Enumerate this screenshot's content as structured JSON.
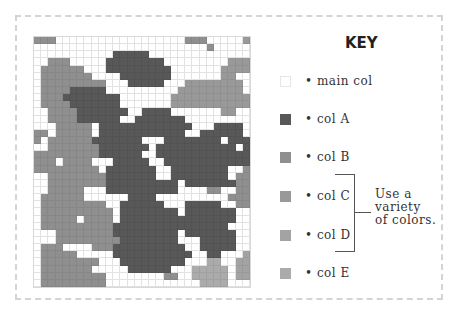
{
  "key": {
    "title": "KEY",
    "items": [
      {
        "label": "• main col",
        "color": "#ffffff",
        "border": "#e6e6e6"
      },
      {
        "label": "• col A",
        "color": "#585858",
        "border": "#585858"
      },
      {
        "label": "• col B",
        "color": "#8f8f8f",
        "border": "#8f8f8f"
      },
      {
        "label": "• col C",
        "color": "#999999",
        "border": "#999999"
      },
      {
        "label": "• col D",
        "color": "#a3a3a3",
        "border": "#a3a3a3"
      },
      {
        "label": "• col E",
        "color": "#ababab",
        "border": "#ababab"
      }
    ],
    "note": [
      "Use a",
      "variety",
      "of colors."
    ]
  },
  "grid": {
    "cols": 30,
    "rows": 35,
    "palette": {
      ".": "#ffffff",
      "A": "#585858",
      "B": "#8f8f8f",
      "C": "#999999",
      "D": "#a3a3a3",
      "E": "#ababab"
    },
    "cells": [
      "BBB..................BBB.....C",
      "........................B.....",
      "...........AAAAA..............",
      "..BBB.....AAAAAAAA.........CCC",
      ".BBBBBB...AAAAAAAAA.......CCCC",
      ".BBBBBBB....AAAAAAA.......CC..",
      ".BBBBBBBBB...AAAAA...CCCCCCCC.",
      ".BBBBAAAAA..........CCCCCCCCC.",
      ".BBBAAAAAAAA.......CCCCCCCCCCC",
      ".BBBBAAAAAAA.......CCCCCCCCCCC",
      "..BBBBAAAAAAA..AAAA.......CC..",
      "..BBBBAAAAAA..AAAAAAA.........",
      "...BBBBB.AAAAAAAAAAAAA...AAAA.",
      "BB.BBBBB.AAAAAAAAAAAA..AAAAAA.",
      "B.BBBBBBAAAAAAA...AAAAAAAA.AAA",
      "..BBBBBBBAAAAAAA.AAAAAAAAAAA.A",
      "BBBBBBBBBAAAAAA..AAAAAAAAAAAAA",
      "BBB.BBBB...AAAAA..AAAAAAAAAAAA",
      "BBBBBBBBB.AAAAAAA..AAAAAAAA..B",
      "..BBBBBBBBAAAAAAA..AAAAAAAA.BB",
      "..BBBBBBBBAAAAAAAAAA.AAAAAAABB",
      "..BBBBB...AAAAAAAAAA....BB..BB",
      ".BBBBBB......AAAA..........BBB",
      ".BBBBBBBBB..AAAAAA...AAAAA..BB",
      ".BBBBBBBBBB.AAAAAAAA.AAAAAAA..",
      ".BBBBB.BBBB.AAAAAAAAAAAAAAAA..",
      ".BBBBBBBBBBAAAAAAAAAAAAAAAA...",
      "...BBBBBBBBAAAAAAAAA.AAAAAAA..",
      "...BBBBBBBBBAAAAAAAA...AAAAA..",
      ".BBB....BBBAAAAAAAAAA..AAAAA..",
      ".BBBBB.....AAAAAAAAAAA..AA...D",
      ".BBBBBBBB...AAAAAAAAA...EE..DD",
      ".BBBBBBB.....AAAAAA...EEEEE.DD",
      ".BBBBBBBBB........BB..EEEEE.DD",
      ".BBBBBBBBB.............EEEE..."
    ]
  }
}
